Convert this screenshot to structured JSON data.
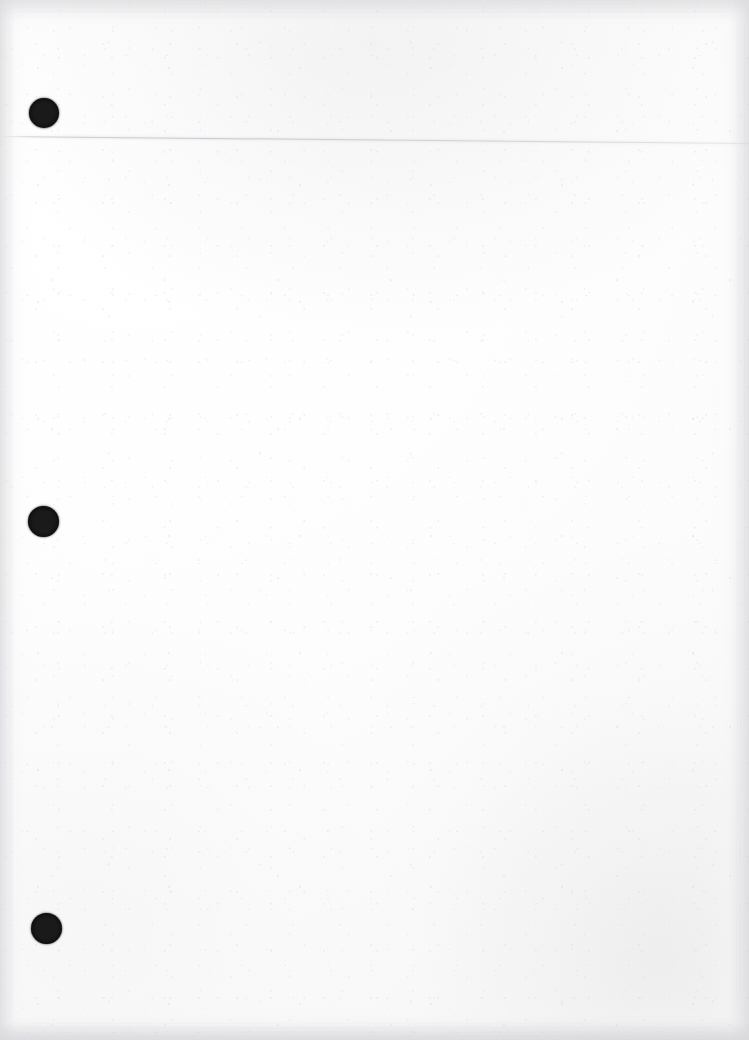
{
  "document": {
    "type": "scanned-page",
    "title": "",
    "body_text": "",
    "page_width": 749,
    "page_height": 1040,
    "background_color": "#fefefe",
    "is_blank": true,
    "visible_text_content": ""
  },
  "artifacts": {
    "punch_holes": [
      {
        "name": "punch-hole-1",
        "center_x": 44,
        "center_y": 113,
        "diameter": 30,
        "color": "#080808"
      },
      {
        "name": "punch-hole-2",
        "center_x": 43,
        "center_y": 521,
        "diameter": 31,
        "color": "#080808"
      },
      {
        "name": "punch-hole-3",
        "center_x": 46,
        "center_y": 928,
        "diameter": 31,
        "color": "#080808"
      }
    ],
    "ruled_line": {
      "name": "faint-horizontal-line",
      "start_x": 0,
      "start_y": 133,
      "end_x": 749,
      "end_y": 140,
      "color": "#b7b7c0",
      "thickness": 1
    },
    "paper_texture": {
      "grain": "fine speckle",
      "tone_bottom_right": "#e8e8ea",
      "tone_top_edge": "#e7e7e9",
      "base_tone": "#fefefe"
    }
  }
}
